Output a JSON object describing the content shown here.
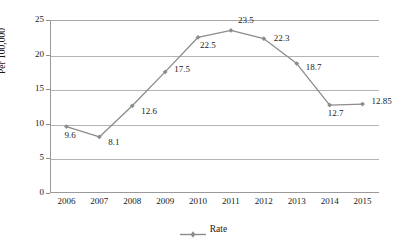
{
  "chart_data": {
    "type": "line",
    "title": "",
    "xlabel": "",
    "ylabel": "Per 100,000",
    "categories": [
      "2006",
      "2007",
      "2008",
      "2009",
      "2010",
      "2011",
      "2012",
      "2013",
      "2014",
      "2015"
    ],
    "series": [
      {
        "name": "Rate",
        "values": [
          9.6,
          8.1,
          12.6,
          17.5,
          22.5,
          23.5,
          22.3,
          18.7,
          12.7,
          12.85
        ],
        "color": "#8c8c8c",
        "marker": "diamond"
      }
    ],
    "point_labels": [
      "9.6",
      "8.1",
      "12.6",
      "17.5",
      "22.5",
      "23.5",
      "22.3",
      "18.7",
      "12.7",
      "12.85"
    ],
    "ylim": [
      0,
      25
    ],
    "yticks": [
      0,
      5,
      10,
      15,
      20,
      25
    ],
    "ytick_labels": [
      "0",
      "5",
      "10",
      "15",
      "20",
      "25"
    ],
    "grid": true,
    "grid_color": "#b4b4b4",
    "legend_position": "bottom",
    "legend_entries": [
      "Rate"
    ],
    "axis_color": "#9a9a9a",
    "text_color": "#1a1a1a"
  },
  "legend": {
    "rate_label": "Rate"
  },
  "axis": {
    "y_title": "Per 100,000"
  }
}
